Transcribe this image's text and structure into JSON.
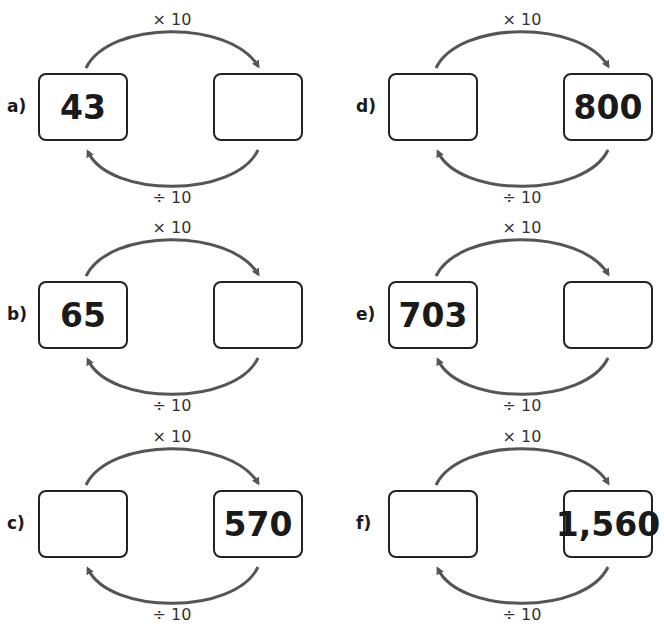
{
  "operations": {
    "multiply": "× 10",
    "divide": "÷ 10"
  },
  "problems": [
    {
      "label": "a)",
      "left": "43",
      "right": ""
    },
    {
      "label": "b)",
      "left": "65",
      "right": ""
    },
    {
      "label": "c)",
      "left": "",
      "right": "570"
    },
    {
      "label": "d)",
      "left": "",
      "right": "800"
    },
    {
      "label": "e)",
      "left": "703",
      "right": ""
    },
    {
      "label": "f)",
      "left": "",
      "right": "1,560"
    }
  ]
}
